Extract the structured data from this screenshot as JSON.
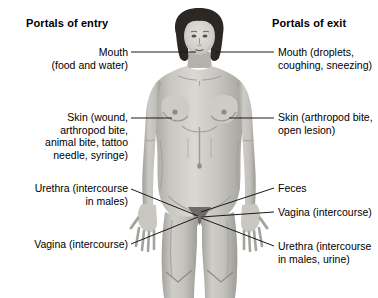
{
  "figure": {
    "title_entry": "Portals of entry",
    "title_exit": "Portals of exit",
    "colors": {
      "background": "#ffffff",
      "text": "#000000",
      "leader_line": "#1a1a1a",
      "hair_dark": "#2b2724",
      "skin_light": "#d8d6d1",
      "skin_mid": "#b9b7b1",
      "skin_shadow": "#9a9894"
    }
  },
  "labels_entry": [
    {
      "name": "mouth",
      "text": "Mouth\n(food and water)",
      "line1": "Mouth",
      "line2": "(food and water)"
    },
    {
      "name": "skin",
      "text": "Skin (wound, arthropod bite, animal bite, tattoo needle, syringe)",
      "line1": "Skin (wound,",
      "line2": "arthropod bite,",
      "line3": "animal bite, tattoo",
      "line4": "needle, syringe)"
    },
    {
      "name": "urethra",
      "text": "Urethra (intercourse in males)",
      "line1": "Urethra (intercourse",
      "line2": "in males)"
    },
    {
      "name": "vagina",
      "text": "Vagina (intercourse)",
      "line1": "Vagina (intercourse)"
    }
  ],
  "labels_exit": [
    {
      "name": "mouth",
      "text": "Mouth (droplets, coughing, sneezing)",
      "line1": "Mouth (droplets,",
      "line2": "coughing, sneezing)"
    },
    {
      "name": "skin",
      "text": "Skin (arthropod bite, open lesion)",
      "line1": "Skin (arthropod bite,",
      "line2": "open lesion)"
    },
    {
      "name": "feces",
      "text": "Feces",
      "line1": "Feces"
    },
    {
      "name": "vagina",
      "text": "Vagina (intercourse)",
      "line1": "Vagina (intercourse)"
    },
    {
      "name": "urethra",
      "text": "Urethra (intercourse in males, urine)",
      "line1": "Urethra (intercourse",
      "line2": "in males, urine)"
    }
  ]
}
